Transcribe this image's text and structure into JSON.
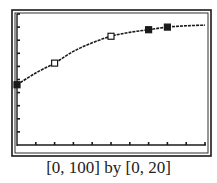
{
  "chart_data": {
    "type": "scatter",
    "title": "",
    "xlabel": "",
    "ylabel": "",
    "xlim": [
      0,
      100
    ],
    "ylim": [
      0,
      20
    ],
    "x_tick_step": 10,
    "y_tick_step": 2,
    "grid": false,
    "caption": "[0, 100] by [0, 20]",
    "series": [
      {
        "name": "fitted curve",
        "kind": "line",
        "style": "dashed-dark",
        "x": [
          0,
          10,
          20,
          30,
          40,
          50,
          60,
          70,
          80,
          90,
          100
        ],
        "y": [
          9.2,
          11.0,
          12.5,
          14.3,
          15.6,
          16.6,
          17.2,
          17.6,
          18.0,
          18.2,
          18.3
        ]
      },
      {
        "name": "data points (open)",
        "kind": "points",
        "marker": "open-square",
        "x": [
          20,
          50
        ],
        "y": [
          12.5,
          16.6
        ]
      },
      {
        "name": "data points (filled)",
        "kind": "points",
        "marker": "filled-square",
        "x": [
          0,
          70,
          80
        ],
        "y": [
          9.2,
          17.6,
          18.0
        ]
      }
    ]
  },
  "colors": {
    "ink": "#1a1a1a",
    "background": "#ffffff"
  }
}
